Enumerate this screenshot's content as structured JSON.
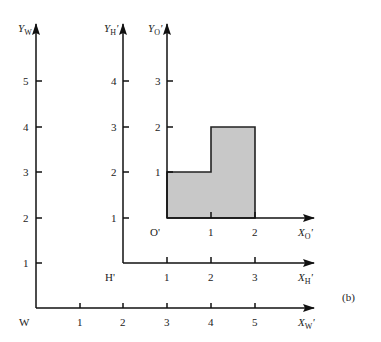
{
  "figure": {
    "panel_label": "(b)"
  },
  "frames": {
    "world": {
      "origin_label": "W",
      "x_axis": {
        "label": "X",
        "subscript": "W",
        "prime": "'",
        "ticks": [
          "1",
          "2",
          "3",
          "4",
          "5"
        ]
      },
      "y_axis": {
        "label": "Y",
        "subscript": "W",
        "prime": "",
        "ticks": [
          "1",
          "2",
          "3",
          "4",
          "5"
        ]
      }
    },
    "house": {
      "origin_label": "H'",
      "x_axis": {
        "label": "X",
        "subscript": "H",
        "prime": "'",
        "ticks": [
          "1",
          "2",
          "3"
        ]
      },
      "y_axis": {
        "label": "Y",
        "subscript": "H",
        "prime": "'",
        "ticks": [
          "1",
          "2",
          "3",
          "4"
        ]
      }
    },
    "object": {
      "origin_label": "O'",
      "x_axis": {
        "label": "X",
        "subscript": "O",
        "prime": "'",
        "ticks": [
          "1",
          "2"
        ]
      },
      "y_axis": {
        "label": "Y",
        "subscript": "O",
        "prime": "'",
        "ticks": [
          "1",
          "2",
          "3"
        ]
      }
    }
  },
  "shape": {
    "fill": "#c8c8c8",
    "stroke": "#222222",
    "vertices_in_O": [
      [
        0,
        0
      ],
      [
        2,
        0
      ],
      [
        2,
        2
      ],
      [
        1,
        2
      ],
      [
        1,
        1
      ],
      [
        0,
        1
      ]
    ]
  }
}
